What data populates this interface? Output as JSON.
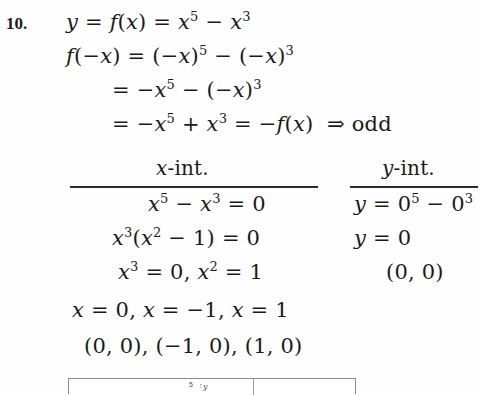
{
  "problem": {
    "number": "10."
  },
  "work": {
    "line_1": {
      "lhs": "y",
      "eq1": "=",
      "fx": "f(x)",
      "eq2": "=",
      "rhs": "x⁵ − x³",
      "full": "y = f(x) = x^5 - x^3"
    },
    "line_2": {
      "full": "f(-x) = (-x)^5 - (-x)^3"
    },
    "line_3": {
      "full": "= -x^5 - (-x)^3"
    },
    "line_4": {
      "full": "= -x^5 + x^3 = -f(x) => odd"
    },
    "conclusion": "odd",
    "implies_symbol": "⇒"
  },
  "table": {
    "headers": {
      "left": {
        "var": "x",
        "suffix": "-int."
      },
      "right": {
        "var": "y",
        "suffix": "-int."
      }
    },
    "left_column": [
      "x^5 - x^3 = 0",
      "x^3(x^2 - 1) = 0",
      "x^3 = 0, x^2 = 1"
    ],
    "right_column": [
      "y = 0^5 - 0^3",
      "y = 0",
      "(0, 0)"
    ]
  },
  "answers": {
    "roots": "x = 0, x = -1, x = 1",
    "points": "(0, 0), (-1, 0), (1, 0)"
  },
  "graph": {
    "tick_value": "5",
    "axis_label": "y",
    "arrow": "↑"
  },
  "colors": {
    "ink": "#1a1a1a",
    "rule": "#2a2a2a",
    "paper": "#fefefe",
    "box_border": "#8a8a8a"
  }
}
